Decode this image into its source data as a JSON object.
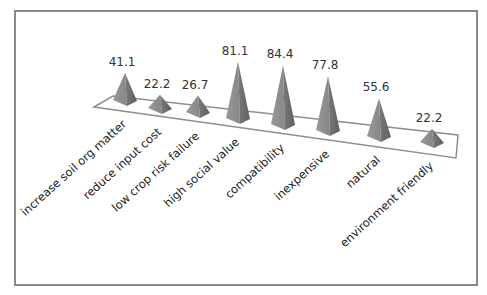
{
  "chart_data": {
    "type": "bar",
    "style": "3d-pyramid",
    "title": "",
    "xlabel": "",
    "ylabel": "",
    "categories": [
      "increase soil org matter",
      "reduce input cost",
      "low crop risk failure",
      "high social value",
      "compatibility",
      "inexpensive",
      "natural",
      "environment friendly"
    ],
    "values": [
      41.1,
      22.2,
      26.7,
      81.1,
      84.4,
      77.8,
      55.6,
      22.2
    ],
    "value_labels": [
      "41.1",
      "22.2",
      "26.7",
      "81.1",
      "84.4",
      "77.8",
      "55.6",
      "22.2"
    ],
    "grid": false,
    "legend": "none",
    "colors": {
      "pyramid": "#8c8c8c",
      "pyramid_light": "#b5b5b5",
      "pyramid_dark": "#6e6e6e",
      "frame": "#8a8a8a",
      "floor": "#8f8f8f"
    }
  }
}
